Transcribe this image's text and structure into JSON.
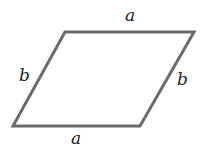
{
  "diagram": {
    "shape": "parallelogram",
    "stroke_color": "#6b6b6b",
    "label_color": "#222222",
    "vertices": [
      [
        65,
        32
      ],
      [
        194,
        32
      ],
      [
        140,
        126
      ],
      [
        13,
        126
      ]
    ],
    "labels": {
      "top": "a",
      "left": "b",
      "right": "b",
      "bottom": "a"
    }
  }
}
